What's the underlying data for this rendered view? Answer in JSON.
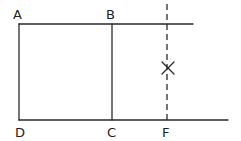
{
  "diagram": {
    "type": "geometry-construction",
    "points": [
      {
        "id": "A",
        "label": "A"
      },
      {
        "id": "B",
        "label": "B"
      },
      {
        "id": "C",
        "label": "C"
      },
      {
        "id": "D",
        "label": "D"
      },
      {
        "id": "F",
        "label": "F"
      }
    ],
    "marker": {
      "label": "X",
      "description": "cross mark on dashed line above F"
    },
    "segments": [
      {
        "from": "A",
        "to": "B",
        "style": "solid",
        "extends_beyond": "B"
      },
      {
        "from": "A",
        "to": "D",
        "style": "solid"
      },
      {
        "from": "B",
        "to": "C",
        "style": "solid"
      },
      {
        "from": "D",
        "to": "C",
        "style": "solid",
        "extends_beyond": "F"
      },
      {
        "from": "F",
        "to": "above top line",
        "style": "dashed"
      }
    ],
    "labels": {
      "A": "A",
      "B": "B",
      "C": "C",
      "D": "D",
      "F": "F"
    },
    "stroke_color": "#2a2a2a"
  }
}
